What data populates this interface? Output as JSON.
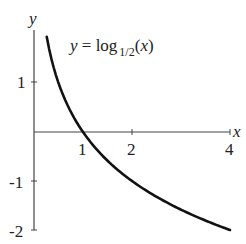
{
  "chart_data": {
    "type": "line",
    "title_parts": {
      "main": "y = log",
      "sub": "1/2",
      "arg": "(x)"
    },
    "xlabel": "x",
    "ylabel": "y",
    "xlim": [
      0,
      4
    ],
    "ylim": [
      -2,
      2
    ],
    "x_ticks": [
      1,
      2,
      4
    ],
    "x_tick_labels": [
      "1",
      "2",
      "4"
    ],
    "y_ticks": [
      1,
      -1,
      -2
    ],
    "y_tick_labels": [
      "1",
      "-1",
      "-2"
    ],
    "grid": false,
    "legend": null,
    "series": [
      {
        "name": "log_{1/2}(x)",
        "x": [
          0.26,
          0.35,
          0.5,
          0.75,
          1,
          1.5,
          2,
          2.5,
          3,
          3.5,
          4
        ],
        "values": [
          1.94,
          1.51,
          1,
          0.42,
          0,
          -0.58,
          -1,
          -1.32,
          -1.58,
          -1.81,
          -2
        ]
      }
    ],
    "colors": {
      "curve": "#111111",
      "axes": "#444444",
      "text": "#222222"
    }
  }
}
